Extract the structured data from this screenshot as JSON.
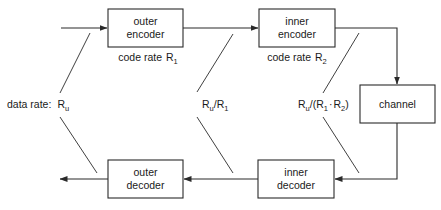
{
  "diagram": {
    "type": "block-diagram",
    "colors": {
      "stroke": "#2a2a2a",
      "text": "#1a1a1a",
      "background": "#ffffff"
    },
    "blocks": {
      "outer_encoder": {
        "line1": "outer",
        "line2": "encoder"
      },
      "inner_encoder": {
        "line1": "inner",
        "line2": "encoder"
      },
      "channel": {
        "label": "channel"
      },
      "inner_decoder": {
        "line1": "inner",
        "line2": "decoder"
      },
      "outer_decoder": {
        "line1": "outer",
        "line2": "decoder"
      }
    },
    "code_rates": {
      "outer": {
        "prefix": "code rate",
        "symbol": "R",
        "sub": "1"
      },
      "inner": {
        "prefix": "code rate",
        "symbol": "R",
        "sub": "2"
      }
    },
    "data_rates": {
      "input": {
        "prefix": "data rate:",
        "symbol": "R",
        "sub": "u"
      },
      "between": {
        "a": "R",
        "a_sub": "u",
        "sep": "/R",
        "b_sub": "1"
      },
      "channel": {
        "a": "R",
        "a_sub": "u",
        "open": "/(R",
        "b_sub": "1",
        "dot": "·",
        "c": "R",
        "c_sub": "2",
        "close": ")"
      }
    },
    "edges": [
      {
        "from": "input",
        "to": "outer_encoder"
      },
      {
        "from": "outer_encoder",
        "to": "inner_encoder"
      },
      {
        "from": "inner_encoder",
        "to": "channel"
      },
      {
        "from": "channel",
        "to": "inner_decoder"
      },
      {
        "from": "inner_decoder",
        "to": "outer_decoder"
      },
      {
        "from": "outer_decoder",
        "to": "output"
      }
    ]
  }
}
